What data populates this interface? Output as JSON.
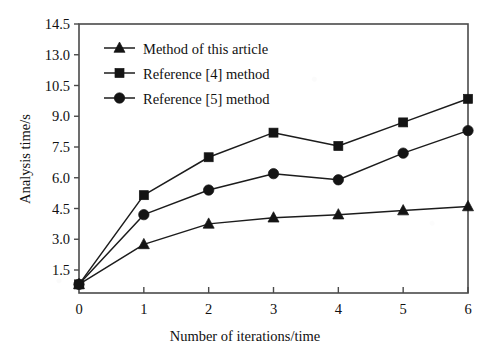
{
  "chart_data": {
    "type": "line",
    "title": "",
    "xlabel": "Number of iterations/time",
    "ylabel": "Analysis time/s",
    "grid": false,
    "legend_position": "top-left-inside",
    "x": [
      0,
      1,
      2,
      3,
      4,
      5,
      6
    ],
    "x_tick_labels": [
      "0",
      "1",
      "2",
      "3",
      "4",
      "5",
      "6"
    ],
    "xlim": [
      0,
      6
    ],
    "y_tick_labels": [
      "1.5",
      "3.0",
      "4.5",
      "6.0",
      "7.5",
      "9.0",
      "10.5",
      "13.0",
      "14.5"
    ],
    "y_tick_values": [
      1.5,
      3.0,
      4.5,
      6.0,
      7.5,
      9.0,
      10.5,
      13.0,
      14.5
    ],
    "y_axis_note": "tick labels are evenly spaced in pixels; 10.5 to 13.0 is a non-uniform step",
    "series": [
      {
        "name": "Method of this article",
        "marker": "triangle",
        "values": [
          0.8,
          2.75,
          3.75,
          4.05,
          4.2,
          4.4,
          4.6
        ]
      },
      {
        "name": "Reference [4] method",
        "marker": "square",
        "values": [
          0.8,
          5.15,
          7.0,
          8.2,
          7.55,
          8.7,
          9.85
        ]
      },
      {
        "name": "Reference [5] method",
        "marker": "circle",
        "values": [
          0.8,
          4.2,
          5.4,
          6.2,
          5.9,
          7.2,
          8.3
        ]
      }
    ]
  },
  "legend": {
    "entries": [
      {
        "label": "Method of this article",
        "marker": "triangle"
      },
      {
        "label": "Reference [4] method",
        "marker": "square"
      },
      {
        "label": "Reference [5] method",
        "marker": "circle"
      }
    ]
  },
  "colors": {
    "ink": "#141414",
    "axis": "#4a4a4a",
    "background": "#ffffff"
  }
}
